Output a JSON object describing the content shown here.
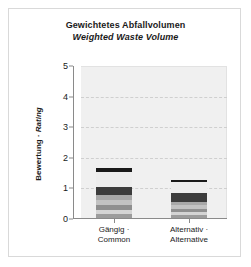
{
  "figure": {
    "title_de": "Gewichtetes Abfallvolumen",
    "title_en": "Weighted Waste Volume",
    "ylabel_de": "Bewertung · ",
    "ylabel_en": "Rating"
  },
  "chart_data": {
    "type": "bar",
    "stacked": true,
    "xlabel": "",
    "ylabel": "Bewertung · Rating",
    "ylim": [
      0,
      5
    ],
    "yticks": [
      0,
      1,
      2,
      3,
      4,
      5
    ],
    "ytick_labels": [
      "0",
      "1",
      "2",
      "3",
      "4",
      "5"
    ],
    "grid": true,
    "legend": "none",
    "categories": [
      "Gängig · Common",
      "Alternativ · Alternative"
    ],
    "category_labels": [
      {
        "line1": "Gängig ·",
        "line2": "Common"
      },
      {
        "line1": "Alternativ ·",
        "line2": "Alternative"
      }
    ],
    "totals": [
      1.63,
      1.24
    ],
    "series": [
      {
        "name": "Segment 1",
        "color": "#9c9c9c",
        "values": [
          0.13,
          0.1
        ]
      },
      {
        "name": "Segment 2",
        "color": "#d4d4d4",
        "values": [
          0.13,
          0.1
        ]
      },
      {
        "name": "Segment 3",
        "color": "#8f8f8f",
        "values": [
          0.16,
          0.1
        ]
      },
      {
        "name": "Segment 4",
        "color": "#c2c2c2",
        "values": [
          0.16,
          0.13
        ]
      },
      {
        "name": "Segment 5",
        "color": "#a8a8a8",
        "values": [
          0.16,
          0.1
        ]
      },
      {
        "name": "Segment 6",
        "color": "#3c3c3c",
        "values": [
          0.29,
          0.29
        ]
      },
      {
        "name": "Segment 7",
        "color": "#ededed",
        "values": [
          0.49,
          0.36
        ]
      },
      {
        "name": "Segment 8",
        "color": "#1a1a1a",
        "values": [
          0.11,
          0.06
        ]
      }
    ],
    "colors": {
      "plot_background": "#f0f0f0",
      "gridline": "#cfcfcf",
      "axis": "#8a8a8a",
      "text": "#1a1a1a",
      "card_border": "#d9d9d9"
    }
  }
}
